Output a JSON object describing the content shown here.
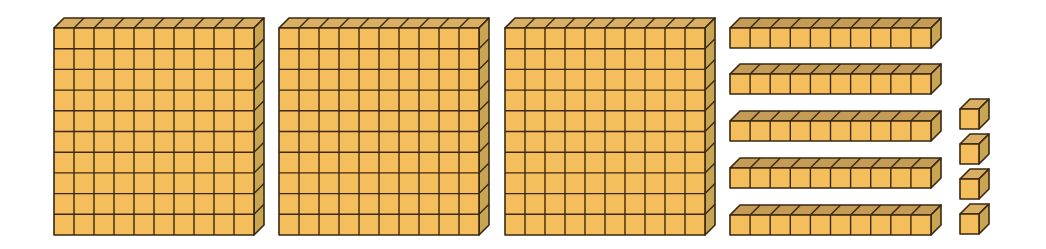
{
  "diagram": {
    "represented_number": 354,
    "colors": {
      "front": "#F4BE5D",
      "top": "#D9B063",
      "rod_top": "#C49C56",
      "side": "#C8A552",
      "outline": "#3A2812",
      "background": "#FFFFFF"
    },
    "groups": [
      {
        "name": "hundreds",
        "label": "flat",
        "count": 3,
        "cells_x": 10,
        "cells_y": 10
      },
      {
        "name": "tens",
        "label": "rod",
        "count": 5,
        "cells_x": 10,
        "cells_y": 1
      },
      {
        "name": "ones",
        "label": "unit",
        "count": 4,
        "cells_x": 1,
        "cells_y": 1
      }
    ],
    "flats": [
      {
        "x": 54,
        "y": 28,
        "w": 200,
        "h": 207
      },
      {
        "x": 279,
        "y": 28,
        "w": 200,
        "h": 207
      },
      {
        "x": 505,
        "y": 28,
        "w": 200,
        "h": 207
      }
    ],
    "rods": [
      {
        "x": 730,
        "y": 28,
        "w": 201,
        "h": 20
      },
      {
        "x": 730,
        "y": 74,
        "w": 201,
        "h": 20
      },
      {
        "x": 730,
        "y": 121,
        "w": 201,
        "h": 20
      },
      {
        "x": 730,
        "y": 168,
        "w": 201,
        "h": 20
      },
      {
        "x": 730,
        "y": 215,
        "w": 201,
        "h": 20
      }
    ],
    "units": [
      {
        "x": 960,
        "y": 109,
        "w": 19,
        "h": 20
      },
      {
        "x": 960,
        "y": 144,
        "w": 19,
        "h": 20
      },
      {
        "x": 960,
        "y": 179,
        "w": 19,
        "h": 20
      },
      {
        "x": 960,
        "y": 214,
        "w": 19,
        "h": 20
      }
    ],
    "depth": {
      "dx": 10,
      "dy": -10
    }
  }
}
